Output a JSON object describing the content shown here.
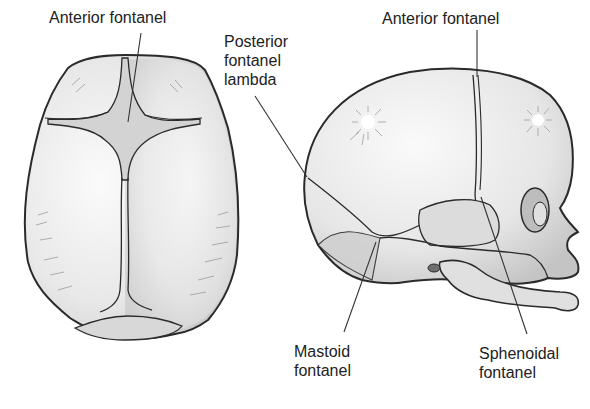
{
  "figure": {
    "views": [
      {
        "id": "superior-view",
        "description": "Top view of infant skull"
      },
      {
        "id": "lateral-view",
        "description": "Side view of infant skull"
      }
    ],
    "labels": {
      "top_anterior": {
        "lines": [
          "Anterior fontanel"
        ]
      },
      "posterior": {
        "lines": [
          "Posterior",
          "fontanel",
          "lambda"
        ]
      },
      "side_anterior": {
        "lines": [
          "Anterior fontanel"
        ]
      },
      "mastoid": {
        "lines": [
          "Mastoid",
          "fontanel"
        ]
      },
      "sphenoidal": {
        "lines": [
          "Sphenoidal",
          "fontanel"
        ]
      }
    },
    "colors": {
      "bone_fill": "#e6e6e6",
      "bone_highlight": "#f7f7f7",
      "fontanel_fill": "#d2d2d2",
      "outline": "#2a2a2a",
      "leader_line": "#333333"
    }
  }
}
